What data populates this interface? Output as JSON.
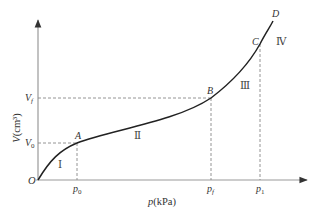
{
  "diagram": {
    "type": "pressure-volume curve",
    "axes": {
      "x_label": "p(kPa)",
      "y_label": "V(cm³)",
      "origin_label": "O"
    },
    "points": {
      "A": "A",
      "B": "B",
      "C": "C",
      "D": "D"
    },
    "y_ticks": {
      "V0": {
        "base": "V",
        "sub": "0"
      },
      "Vf": {
        "base": "V",
        "sub": "f"
      }
    },
    "x_ticks": {
      "p0": {
        "base": "p",
        "sub": "0"
      },
      "pf": {
        "base": "p",
        "sub": "f"
      },
      "p1": {
        "base": "p",
        "sub": "1"
      }
    },
    "regions": {
      "I": "Ⅰ",
      "II": "Ⅱ",
      "III": "Ⅲ",
      "IV": "Ⅳ"
    },
    "colors": {
      "curve": "#222222",
      "axis": "#888888",
      "dashed": "#777777",
      "text": "#333333"
    }
  }
}
